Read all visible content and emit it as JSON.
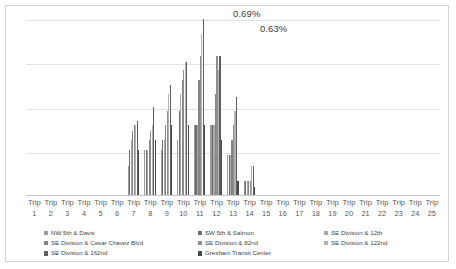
{
  "chart_data": {
    "type": "bar",
    "title": "",
    "subtitle": "",
    "xlabel": "",
    "ylabel": "",
    "grid": true,
    "gridlines_y": [
      0.0,
      0.175,
      0.35,
      0.525,
      0.69
    ],
    "ylim": [
      0,
      0.69
    ],
    "legend_position": "bottom",
    "annotations": [
      {
        "text": "0.69%",
        "x_rel": 0.5,
        "y_value": 0.69
      },
      {
        "text": "0.63%",
        "x_rel": 0.565,
        "y_value": 0.63
      }
    ],
    "categories": [
      "Trip 1",
      "Trip 2",
      "Trip 3",
      "Trip 4",
      "Trip 5",
      "Trip 6",
      "Trip 7",
      "Trip 8",
      "Trip 9",
      "Trip 10",
      "Trip 11",
      "Trip 12",
      "Trip 13",
      "Trip 14",
      "Trip 15",
      "Trip 16",
      "Trip 17",
      "Trip 18",
      "Trip 19",
      "Trip 20",
      "Trip 21",
      "Trip 22",
      "Trip 23",
      "Trip 24",
      "Trip 25"
    ],
    "series": [
      {
        "name": "NW 5th & Davis",
        "color": "#9a9a9a",
        "values": [
          0,
          0,
          0,
          0,
          0,
          0,
          0.115,
          0.175,
          0.175,
          0.215,
          0.275,
          0.275,
          0.155,
          0.055,
          0,
          0,
          0,
          0,
          0,
          0,
          0,
          0,
          0,
          0,
          0
        ]
      },
      {
        "name": "SW 5th & Salmon",
        "color": "#6e6e6e",
        "values": [
          0,
          0,
          0,
          0,
          0,
          0,
          0.175,
          0.175,
          0.215,
          0.33,
          0.275,
          0.275,
          0.155,
          0.055,
          0,
          0,
          0,
          0,
          0,
          0,
          0,
          0,
          0,
          0,
          0
        ]
      },
      {
        "name": "SE Division & 12th",
        "color": "#a8a8a8",
        "values": [
          0,
          0,
          0,
          0,
          0,
          0,
          0.215,
          0.175,
          0.215,
          0.395,
          0.275,
          0.275,
          0.155,
          0.055,
          0,
          0,
          0,
          0,
          0,
          0,
          0,
          0,
          0,
          0,
          0
        ]
      },
      {
        "name": "SE Division & Cesar Chavez Blvd",
        "color": "#858585",
        "values": [
          0,
          0,
          0,
          0,
          0,
          0,
          0.25,
          0.215,
          0.275,
          0.45,
          0.45,
          0.395,
          0.215,
          0.055,
          0,
          0,
          0,
          0,
          0,
          0,
          0,
          0,
          0,
          0,
          0
        ]
      },
      {
        "name": "SE Division & 82nd",
        "color": "#8f8f8f",
        "values": [
          0,
          0,
          0,
          0,
          0,
          0,
          0.275,
          0.25,
          0.33,
          0.49,
          0.545,
          0.545,
          0.275,
          0.055,
          0,
          0,
          0,
          0,
          0,
          0,
          0,
          0,
          0,
          0,
          0
        ]
      },
      {
        "name": "SE Division & 122nd",
        "color": "#b2b2b2",
        "values": [
          0,
          0,
          0,
          0,
          0,
          0,
          0.275,
          0.275,
          0.395,
          0.52,
          0.63,
          0.49,
          0.33,
          0.115,
          0,
          0,
          0,
          0,
          0,
          0,
          0,
          0,
          0,
          0,
          0
        ]
      },
      {
        "name": "SE Division & 162nd",
        "color": "#5f5f5f",
        "values": [
          0,
          0,
          0,
          0,
          0,
          0,
          0.29,
          0.345,
          0.43,
          0.52,
          0.69,
          0.545,
          0.385,
          0.115,
          0,
          0,
          0,
          0,
          0,
          0,
          0,
          0,
          0,
          0,
          0
        ]
      },
      {
        "name": "Gresham Transit Center",
        "color": "#4a4a4a",
        "values": [
          0,
          0,
          0,
          0,
          0,
          0,
          0.175,
          0.215,
          0.275,
          0.275,
          0.275,
          0.215,
          0.055,
          0.03,
          0,
          0,
          0,
          0,
          0,
          0,
          0,
          0,
          0,
          0,
          0
        ]
      }
    ]
  },
  "legend_columns": [
    [
      "NW 5th & Davis",
      "SE Division & Cesar Chavez Blvd",
      "SE Division & 162nd"
    ],
    [
      "SW 5th & Salmon",
      "SE Division & 82nd",
      "Gresham Transit Center"
    ],
    [
      "SE Division & 12th",
      "SE Division & 122nd"
    ]
  ]
}
